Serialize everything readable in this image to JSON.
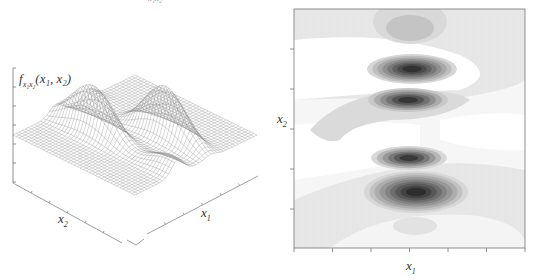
{
  "figure": {
    "top_fragment_label": "x₁x₂"
  },
  "chart_data": [
    {
      "type": "surface",
      "title": "",
      "zlabel": "f_{x1x2}(x1, x2)",
      "zlabel_parts": {
        "f": "f",
        "sub": "x₁x₂",
        "args": "(x₁, x₂)"
      },
      "xlabel": "x1",
      "ylabel": "x2",
      "xlabel_parts": {
        "base": "x",
        "sub": "1"
      },
      "ylabel_parts": {
        "base": "x",
        "sub": "2"
      },
      "style": "wireframe mesh, gray lines on white",
      "description": "Bivariate density with two ridge-shaped peaks elongated along x2, oscillating along x1; flat near zero elsewhere",
      "z_ticks_count": 7,
      "x_ticks_count": 6,
      "y_ticks_count": 6,
      "tick_labels_shown": false,
      "grid": false
    },
    {
      "type": "heatmap",
      "subtype": "filled contour",
      "title": "",
      "xlabel": "x1",
      "ylabel": "x2",
      "xlabel_parts": {
        "base": "x",
        "sub": "1"
      },
      "ylabel_parts": {
        "base": "x",
        "sub": "2"
      },
      "colormap": "grayscale (white = low, black = high)",
      "x_ticks_count": 7,
      "y_ticks_count": 6,
      "tick_labels_shown": false,
      "legend": "none",
      "peaks": [
        {
          "label": "top faint peak",
          "x_frac": 0.5,
          "y_frac": 0.08,
          "intensity": 0.35
        },
        {
          "label": "upper strong peak",
          "x_frac": 0.5,
          "y_frac": 0.24,
          "intensity": 0.95
        },
        {
          "label": "upper-mid peak",
          "x_frac": 0.5,
          "y_frac": 0.38,
          "intensity": 0.75
        },
        {
          "label": "lower-mid peak",
          "x_frac": 0.5,
          "y_frac": 0.6,
          "intensity": 0.72
        },
        {
          "label": "lower strong peak",
          "x_frac": 0.52,
          "y_frac": 0.75,
          "intensity": 1.0
        },
        {
          "label": "bottom faint peak",
          "x_frac": 0.5,
          "y_frac": 0.93,
          "intensity": 0.25
        }
      ]
    }
  ]
}
